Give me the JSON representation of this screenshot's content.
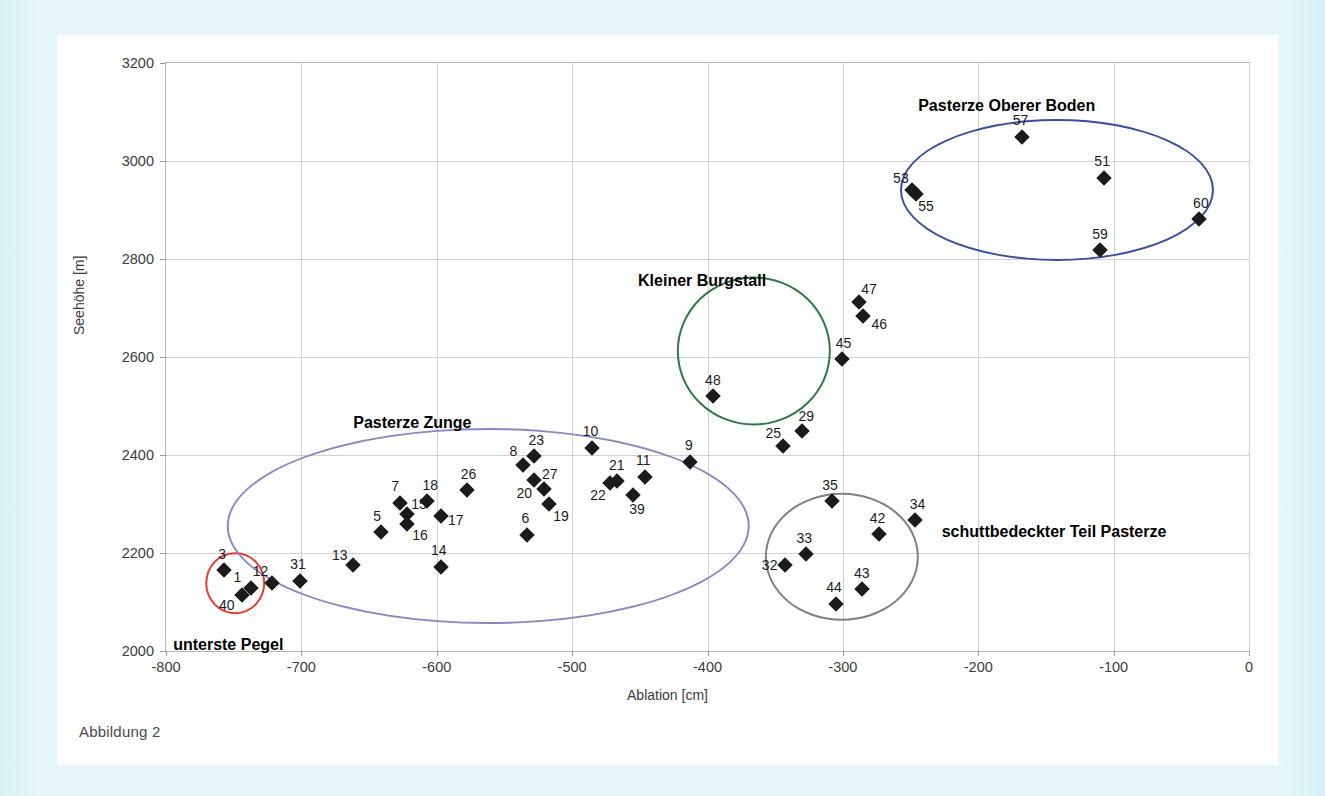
{
  "caption": "Abbildung 2",
  "chart_data": {
    "type": "scatter",
    "title": "",
    "xlabel": "Ablation [cm]",
    "ylabel": "Seehöhe [m]",
    "xlim": [
      -800,
      0
    ],
    "ylim": [
      2000,
      3200
    ],
    "xticks": [
      -800,
      -700,
      -600,
      -500,
      -400,
      -300,
      -200,
      -100,
      0
    ],
    "yticks": [
      2000,
      2200,
      2400,
      2600,
      2800,
      3000,
      3200
    ],
    "grid": true,
    "legend": "none",
    "marker": "filled-diamond",
    "marker_color": "#1b1b1b",
    "points": [
      {
        "label": "1",
        "x": -737,
        "y": 2128
      },
      {
        "label": "3",
        "x": -757,
        "y": 2165
      },
      {
        "label": "5",
        "x": -641,
        "y": 2243
      },
      {
        "label": "6",
        "x": -533,
        "y": 2236
      },
      {
        "label": "7",
        "x": -627,
        "y": 2302
      },
      {
        "label": "8",
        "x": -536,
        "y": 2380
      },
      {
        "label": "9",
        "x": -413,
        "y": 2386
      },
      {
        "label": "10",
        "x": -485,
        "y": 2414
      },
      {
        "label": "11",
        "x": -446,
        "y": 2355
      },
      {
        "label": "12",
        "x": -722,
        "y": 2138
      },
      {
        "label": "13",
        "x": -662,
        "y": 2176
      },
      {
        "label": "14",
        "x": -597,
        "y": 2172
      },
      {
        "label": "15",
        "x": -622,
        "y": 2279
      },
      {
        "label": "16",
        "x": -622,
        "y": 2259
      },
      {
        "label": "17",
        "x": -597,
        "y": 2275
      },
      {
        "label": "18",
        "x": -607,
        "y": 2307
      },
      {
        "label": "19",
        "x": -517,
        "y": 2299
      },
      {
        "label": "20",
        "x": -528,
        "y": 2350
      },
      {
        "label": "21",
        "x": -467,
        "y": 2347
      },
      {
        "label": "22",
        "x": -472,
        "y": 2343
      },
      {
        "label": "23",
        "x": -528,
        "y": 2397
      },
      {
        "label": "25",
        "x": -344,
        "y": 2418
      },
      {
        "label": "26",
        "x": -578,
        "y": 2329
      },
      {
        "label": "27",
        "x": -521,
        "y": 2331
      },
      {
        "label": "29",
        "x": -330,
        "y": 2448
      },
      {
        "label": "31",
        "x": -701,
        "y": 2143
      },
      {
        "label": "32",
        "x": -343,
        "y": 2175
      },
      {
        "label": "33",
        "x": -327,
        "y": 2197
      },
      {
        "label": "34",
        "x": -247,
        "y": 2268
      },
      {
        "label": "35",
        "x": -308,
        "y": 2306
      },
      {
        "label": "39",
        "x": -455,
        "y": 2318
      },
      {
        "label": "40",
        "x": -744,
        "y": 2114
      },
      {
        "label": "42",
        "x": -273,
        "y": 2239
      },
      {
        "label": "43",
        "x": -286,
        "y": 2127
      },
      {
        "label": "44",
        "x": -305,
        "y": 2096
      },
      {
        "label": "45",
        "x": -301,
        "y": 2596
      },
      {
        "label": "46",
        "x": -285,
        "y": 2683
      },
      {
        "label": "47",
        "x": -288,
        "y": 2713
      },
      {
        "label": "48",
        "x": -396,
        "y": 2521
      },
      {
        "label": "51",
        "x": -107,
        "y": 2966
      },
      {
        "label": "53",
        "x": -249,
        "y": 2940
      },
      {
        "label": "55",
        "x": -246,
        "y": 2933
      },
      {
        "label": "57",
        "x": -168,
        "y": 3050
      },
      {
        "label": "59",
        "x": -110,
        "y": 2818
      },
      {
        "label": "60",
        "x": -37,
        "y": 2882
      }
    ],
    "clusters": [
      {
        "name": "unterste Pegel",
        "color": "#e8392b",
        "label_x": -754,
        "label_y": 2012,
        "cx": -749,
        "cy": 2138,
        "rx": 22,
        "ry": 63,
        "members": [
          "3",
          "1",
          "40"
        ]
      },
      {
        "name": "Pasterze Zunge",
        "color": "#8a87c4",
        "label_x": -618,
        "label_y": 2466,
        "cx": -562,
        "cy": 2255,
        "rx": 193,
        "ry": 200,
        "members": [
          "1",
          "3",
          "5",
          "6",
          "7",
          "8",
          "9",
          "10",
          "11",
          "12",
          "13",
          "14",
          "15",
          "16",
          "17",
          "18",
          "19",
          "20",
          "21",
          "22",
          "23",
          "26",
          "27",
          "31",
          "39",
          "40"
        ]
      },
      {
        "name": "Kleiner Burgstall",
        "color": "#2f7a46",
        "label_x": -404,
        "label_y": 2756,
        "cx": -366,
        "cy": 2613,
        "rx": 57,
        "ry": 152,
        "members": [
          "45",
          "46",
          "47",
          "48"
        ]
      },
      {
        "name": "Pasterze Oberer Boden",
        "color": "#3a4fa0",
        "label_x": -179,
        "label_y": 3113,
        "cx": -142,
        "cy": 2940,
        "rx": 116,
        "ry": 145,
        "members": [
          "51",
          "53",
          "55",
          "57",
          "59",
          "60"
        ]
      },
      {
        "name": "schuttbedeckter Teil Pasterze",
        "color": "#808080",
        "label_x": -144,
        "label_y": 2243,
        "cx": -301,
        "cy": 2192,
        "rx": 57,
        "ry": 131,
        "members": [
          "32",
          "33",
          "34",
          "35",
          "42",
          "43",
          "44"
        ]
      }
    ],
    "label_offsets": {
      "1": [
        -14,
        -11
      ],
      "3": [
        -2,
        -16
      ],
      "5": [
        -4,
        -16
      ],
      "6": [
        -2,
        -17
      ],
      "7": [
        -5,
        -17
      ],
      "8": [
        -10,
        -14
      ],
      "9": [
        -1,
        -17
      ],
      "10": [
        -2,
        -17
      ],
      "11": [
        -2,
        -17
      ],
      "12": [
        -11,
        -12
      ],
      "13": [
        -13,
        -10
      ],
      "14": [
        -2,
        -17
      ],
      "15": [
        12,
        -10
      ],
      "16": [
        13,
        11
      ],
      "17": [
        15,
        4
      ],
      "18": [
        3,
        -16
      ],
      "19": [
        12,
        12
      ],
      "20": [
        -10,
        13
      ],
      "21": [
        0,
        -16
      ],
      "22": [
        -12,
        12
      ],
      "23": [
        2,
        -16
      ],
      "25": [
        -10,
        -13
      ],
      "26": [
        2,
        -16
      ],
      "27": [
        6,
        -15
      ],
      "29": [
        4,
        -15
      ],
      "31": [
        -2,
        -17
      ],
      "32": [
        -15,
        0
      ],
      "33": [
        -2,
        -16
      ],
      "34": [
        3,
        -16
      ],
      "35": [
        -2,
        -16
      ],
      "39": [
        4,
        14
      ],
      "40": [
        -15,
        10
      ],
      "42": [
        -2,
        -16
      ],
      "43": [
        0,
        -16
      ],
      "44": [
        -2,
        -17
      ],
      "45": [
        2,
        -16
      ],
      "46": [
        16,
        8
      ],
      "47": [
        10,
        -13
      ],
      "48": [
        0,
        -16
      ],
      "51": [
        -2,
        -17
      ],
      "53": [
        -11,
        -12
      ],
      "55": [
        10,
        12
      ],
      "57": [
        -1,
        -17
      ],
      "59": [
        0,
        -16
      ],
      "60": [
        2,
        -16
      ]
    }
  }
}
